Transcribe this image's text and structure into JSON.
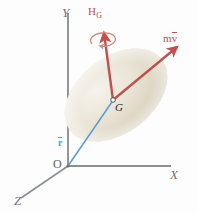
{
  "figure": {
    "type": "mechanics-vector-diagram",
    "background_color": "#fdfdfd",
    "axes": {
      "color": "#8c9093",
      "labels": {
        "x": "X",
        "y": "Y",
        "z": "Z",
        "origin": "O"
      }
    },
    "body": {
      "name": "rigid-body-blob",
      "fill_color": "#ddd7c6",
      "highlight_color": "#f3efe6",
      "rotation_deg": -38
    },
    "vectors": [
      {
        "id": "angular-momentum",
        "label": "H",
        "subscript": "G",
        "color": "#c0504d",
        "description": "angular momentum about G"
      },
      {
        "id": "linear-momentum",
        "label_m": "m",
        "label_v": "v",
        "overbar": true,
        "color": "#c0504d",
        "description": "linear momentum m v-bar"
      },
      {
        "id": "position-vector",
        "label": "r",
        "overbar": true,
        "color": "#5b9bd5",
        "description": "position vector r-bar from O to G"
      }
    ],
    "points": [
      {
        "id": "center-of-mass",
        "label": "G",
        "color": "#2a2a2a"
      },
      {
        "id": "origin",
        "label": "O",
        "color": "#5d6063"
      }
    ],
    "spin_indicator": {
      "id": "spin-arrow",
      "color": "#c88b86",
      "description": "curved rotation arrow around H_G axis"
    }
  }
}
